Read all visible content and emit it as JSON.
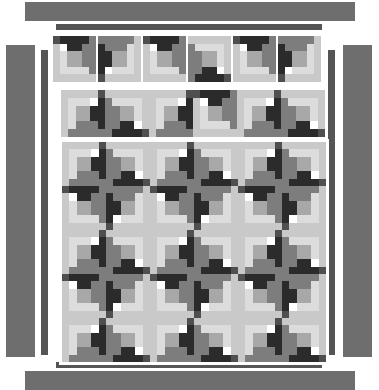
{
  "document": {
    "kind": "quilt-layout-diagram",
    "title": "Log Cabin Quilt Layout",
    "canvas": {
      "width": 379,
      "height": 390,
      "background": "#ffffff"
    }
  },
  "palette": {
    "dark": "#2b2b2b",
    "mid_dark": "#4f4f4f",
    "mid": "#7d7d7d",
    "mid_light": "#a8a8a8",
    "light": "#c9c9c9",
    "very_light": "#dcdcdc",
    "border_bar": "#6e6e6e",
    "border_bar_thin": "#555555",
    "seam_line": "#8a8a8a",
    "background": "#ffffff"
  },
  "borders": {
    "top_wide": {
      "x": 25,
      "y": 2,
      "w": 330,
      "h": 19,
      "color": "#6e6e6e",
      "label": "top-outer-border"
    },
    "top_thin": {
      "x": 56,
      "y": 24,
      "w": 266,
      "h": 6,
      "color": "#555555",
      "label": "top-inner-border"
    },
    "bottom_thin": {
      "x": 56,
      "y": 362,
      "w": 266,
      "h": 6,
      "color": "#555555",
      "label": "bottom-inner-border"
    },
    "bottom_wide": {
      "x": 25,
      "y": 371,
      "w": 330,
      "h": 19,
      "color": "#6e6e6e",
      "label": "bottom-outer-border"
    },
    "left_wide": {
      "x": 6,
      "y": 45,
      "w": 29,
      "h": 312,
      "color": "#6e6e6e",
      "label": "left-outer-border"
    },
    "left_thin": {
      "x": 41,
      "y": 50,
      "w": 7,
      "h": 305,
      "color": "#555555",
      "label": "left-inner-border"
    },
    "right_thin": {
      "x": 328,
      "y": 50,
      "w": 7,
      "h": 305,
      "color": "#555555",
      "label": "right-inner-border"
    },
    "right_wide": {
      "x": 343,
      "y": 45,
      "w": 29,
      "h": 312,
      "color": "#6e6e6e",
      "label": "right-outer-border"
    }
  },
  "sections": {
    "top_block_row": {
      "label": "top-block-row",
      "x": 53,
      "y": 36,
      "block_w": 43,
      "block_h": 46,
      "gap": 2,
      "count": 6,
      "rotations": [
        0,
        270,
        0,
        180,
        0,
        270
      ]
    },
    "sashing_block_row": {
      "label": "sashing-block-row",
      "x": 59,
      "y": 88,
      "block_w": 44,
      "block_h": 47,
      "gap": 0,
      "count": 6,
      "rotations": [
        90,
        180,
        90,
        0,
        90,
        180
      ]
    },
    "main_body": {
      "label": "main-quilt-body",
      "x": 59,
      "y": 139,
      "cols": 6,
      "rows": 5,
      "block_w": 44,
      "block_h": 44,
      "rotations": [
        [
          90,
          180,
          90,
          180,
          90,
          180
        ],
        [
          0,
          270,
          0,
          270,
          0,
          270
        ],
        [
          90,
          180,
          90,
          180,
          90,
          180
        ],
        [
          0,
          270,
          0,
          270,
          0,
          270
        ],
        [
          90,
          180,
          90,
          180,
          90,
          180
        ]
      ]
    }
  },
  "block_definition": {
    "name": "log-cabin-block",
    "unit_grid": 6,
    "description": "Log cabin spiral: centre square with light logs on two sides and dark logs on the other two, built outward in rounds.",
    "segments": [
      {
        "name": "centre",
        "x": 2,
        "y": 2,
        "w": 2,
        "h": 2,
        "shade": "mid_light"
      },
      {
        "name": "round1-top",
        "x": 2,
        "y": 1,
        "w": 2,
        "h": 1,
        "shade": "dark"
      },
      {
        "name": "round1-right",
        "x": 4,
        "y": 1,
        "w": 1,
        "h": 3,
        "shade": "mid"
      },
      {
        "name": "round1-bottom",
        "x": 2,
        "y": 4,
        "w": 3,
        "h": 1,
        "shade": "very_light"
      },
      {
        "name": "round1-left",
        "x": 1,
        "y": 2,
        "w": 1,
        "h": 3,
        "shade": "very_light"
      },
      {
        "name": "round2-top",
        "x": 1,
        "y": 0,
        "w": 4,
        "h": 1,
        "shade": "dark"
      },
      {
        "name": "round2-right",
        "x": 5,
        "y": 0,
        "w": 1,
        "h": 5,
        "shade": "mid"
      },
      {
        "name": "round2-bottom",
        "x": 1,
        "y": 5,
        "w": 5,
        "h": 1,
        "shade": "light"
      },
      {
        "name": "round2-left",
        "x": 0,
        "y": 1,
        "w": 1,
        "h": 5,
        "shade": "light"
      },
      {
        "name": "corner-tl",
        "x": 0,
        "y": 0,
        "w": 1,
        "h": 1,
        "shade": "mid_dark"
      }
    ]
  },
  "legend": {
    "shades": [
      {
        "key": "dark",
        "label": "Dark fabric",
        "hex": "#2b2b2b"
      },
      {
        "key": "mid_dark",
        "label": "Medium-dark fabric",
        "hex": "#4f4f4f"
      },
      {
        "key": "mid",
        "label": "Medium fabric",
        "hex": "#7d7d7d"
      },
      {
        "key": "mid_light",
        "label": "Medium-light fabric",
        "hex": "#a8a8a8"
      },
      {
        "key": "light",
        "label": "Light fabric",
        "hex": "#c9c9c9"
      },
      {
        "key": "very_light",
        "label": "Background fabric",
        "hex": "#dcdcdc"
      }
    ]
  }
}
